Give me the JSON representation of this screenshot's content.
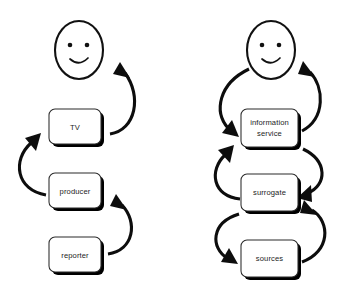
{
  "diagram": {
    "background_color": "#ffffff",
    "stroke_color": "#0d0d0d",
    "box_fill": "#ffffff",
    "columns": [
      {
        "id": "broadcast",
        "name": "broadcast-chain",
        "flow": "one-way",
        "actor": {
          "name": "viewer-face",
          "expression": "smiling"
        },
        "nodes": [
          {
            "id": "tv",
            "label": "TV"
          },
          {
            "id": "producer",
            "label": "producer"
          },
          {
            "id": "reporter",
            "label": "reporter"
          }
        ],
        "links": [
          {
            "from": "reporter",
            "to": "producer",
            "direction": "up",
            "side": "right"
          },
          {
            "from": "producer",
            "to": "tv",
            "direction": "up",
            "side": "left"
          },
          {
            "from": "tv",
            "to": "face",
            "direction": "up",
            "side": "right"
          }
        ]
      },
      {
        "id": "interactive",
        "name": "interactive-chain",
        "flow": "two-way",
        "actor": {
          "name": "user-face",
          "expression": "smiling"
        },
        "nodes": [
          {
            "id": "information-service",
            "label": "information\nservice",
            "line1": "information",
            "line2": "service"
          },
          {
            "id": "surrogate",
            "label": "surrogate"
          },
          {
            "id": "sources",
            "label": "sources"
          }
        ],
        "links": [
          {
            "from": "face",
            "to": "information-service",
            "direction": "down",
            "side": "left"
          },
          {
            "from": "information-service",
            "to": "face",
            "direction": "up",
            "side": "right"
          },
          {
            "from": "surrogate",
            "to": "information-service",
            "direction": "up",
            "side": "left"
          },
          {
            "from": "information-service",
            "to": "surrogate",
            "direction": "down",
            "side": "right"
          },
          {
            "from": "surrogate",
            "to": "sources",
            "direction": "down",
            "side": "left"
          },
          {
            "from": "sources",
            "to": "surrogate",
            "direction": "up",
            "side": "right"
          }
        ]
      }
    ]
  }
}
